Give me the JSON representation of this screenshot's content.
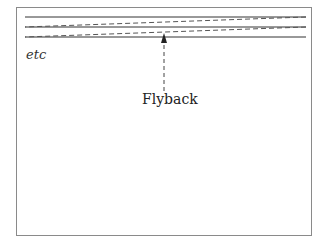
{
  "diagram": {
    "scan_lines": 3,
    "retrace_lines": 2,
    "labels": {
      "etc": "etc",
      "flyback": "Flyback"
    },
    "colors": {
      "line": "#333333",
      "dashed": "#555555",
      "frame": "#8a8a8a"
    }
  }
}
